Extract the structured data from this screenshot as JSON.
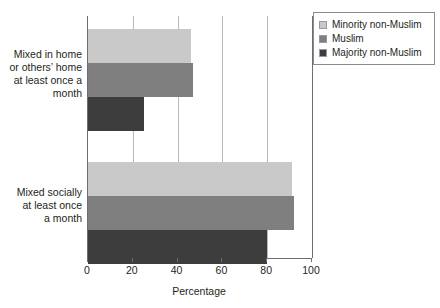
{
  "chart_data": {
    "type": "bar",
    "orientation": "horizontal",
    "title": "",
    "xlabel": "Percentage",
    "ylabel": "",
    "xlim": [
      0,
      100
    ],
    "xticks": [
      0,
      20,
      40,
      60,
      80,
      100
    ],
    "grid": true,
    "legend_position": "top-right",
    "categories": [
      "Mixed in home or others’ home at least once a month",
      "Mixed socially at least once a month"
    ],
    "series": [
      {
        "name": "Minority non-Muslim",
        "color": "#c9c9c9",
        "values": [
          46,
          91
        ]
      },
      {
        "name": "Muslim",
        "color": "#7f7f7f",
        "values": [
          47,
          92
        ]
      },
      {
        "name": "Majority non-Muslim",
        "color": "#3d3d3d",
        "values": [
          25,
          80
        ]
      }
    ]
  },
  "axis": {
    "title": "Percentage",
    "tick_labels": [
      "0",
      "20",
      "40",
      "60",
      "80",
      "100"
    ]
  },
  "categories": [
    {
      "lines": [
        "Mixed in home",
        "or others’ home",
        "at least once a",
        "month"
      ]
    },
    {
      "lines": [
        "Mixed socially",
        "at least once",
        "a month"
      ]
    }
  ],
  "legend": {
    "items": [
      {
        "label": "Minority non-Muslim",
        "color": "#c9c9c9"
      },
      {
        "label": "Muslim",
        "color": "#7f7f7f"
      },
      {
        "label": "Majority non-Muslim",
        "color": "#3d3d3d"
      }
    ]
  }
}
